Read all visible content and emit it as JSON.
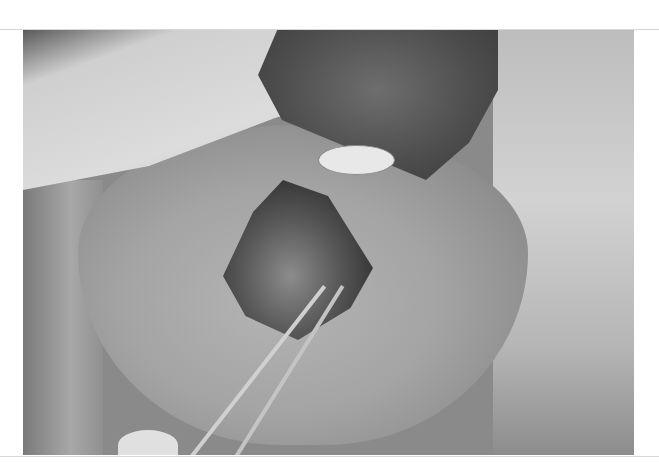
{
  "image": {
    "description": "Grayscale clinical photograph of a surgical procedure on the lower face/lip area, with drapes, a gauze pad, and forceps holding tissue",
    "color_mode": "grayscale",
    "elements": [
      "surgical-drape",
      "gauze-pad",
      "dressing",
      "surgical-wound",
      "forceps",
      "gloved-hand"
    ]
  }
}
